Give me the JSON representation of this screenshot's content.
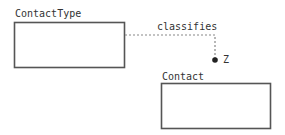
{
  "diagram": {
    "type": "data-model relationship",
    "entities": [
      {
        "id": "contact-type",
        "name": "ContactType"
      },
      {
        "id": "contact",
        "name": "Contact"
      }
    ],
    "relationships": [
      {
        "from": "contact-type",
        "to": "contact",
        "label": "classifies",
        "line_style": "dashed",
        "end_marker": "filled-dot",
        "cardinality": "Z"
      }
    ]
  },
  "colors": {
    "box_stroke": "#555555",
    "connector": "#888888",
    "text": "#333333",
    "dot": "#222222"
  }
}
